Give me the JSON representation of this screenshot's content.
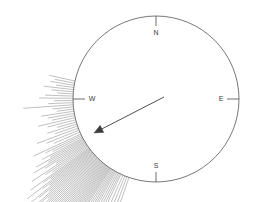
{
  "figure": {
    "name": "wind-rose-compass",
    "width": 254,
    "height": 202,
    "background_color": "#ffffff"
  },
  "chart_data": {
    "type": "scatter",
    "title": "",
    "subtitle": "",
    "xlabel": "",
    "ylabel": "",
    "grid": false,
    "legend_position": "none",
    "projection": "polar-compass",
    "circle": {
      "center_x": 156,
      "center_y": 99,
      "radius": 83,
      "stroke_color": "#555555",
      "stroke_width": 0.8,
      "fill": "none"
    },
    "cardinal_points": [
      {
        "label": "N",
        "angle_deg": 0,
        "tick_x1": 156,
        "tick_y1": 16,
        "tick_x2": 156,
        "tick_y2": 26,
        "label_x": 156,
        "label_y": 35,
        "anchor": "middle"
      },
      {
        "label": "E",
        "angle_deg": 90,
        "tick_x1": 239,
        "tick_y1": 99,
        "tick_x2": 227,
        "tick_y2": 99,
        "label_x": 221,
        "label_y": 101,
        "anchor": "middle"
      },
      {
        "label": "S",
        "angle_deg": 180,
        "tick_x1": 156,
        "tick_y1": 182,
        "tick_x2": 156,
        "tick_y2": 172,
        "label_x": 156,
        "label_y": 168,
        "anchor": "middle"
      },
      {
        "label": "W",
        "angle_deg": 270,
        "tick_x1": 73,
        "tick_y1": 99,
        "tick_x2": 85,
        "tick_y2": 99,
        "label_x": 92,
        "label_y": 101,
        "anchor": "middle"
      }
    ],
    "tick_style": {
      "stroke_color": "#4a4a4a",
      "stroke_width": 0.8
    },
    "mean_arrow": {
      "label": "mean direction",
      "tail_x": 164,
      "tail_y": 97,
      "tip_x": 94,
      "tip_y": 133,
      "bearing_deg": 242,
      "stroke_color": "#3c3c3c",
      "stroke_width": 0.9,
      "head_length": 9,
      "head_width": 4
    },
    "rays": {
      "stroke_color": "#8c8c8c",
      "stroke_width": 0.55,
      "origin_note": "each ray starts on the circle edge at its own bearing and extends radially outward",
      "bearings_deg": [
        282.5,
        281.0,
        279.5,
        278.0,
        276.5,
        275.0,
        273.5,
        272.0,
        270.5,
        269.0,
        267.5,
        266.0,
        264.5,
        263.0,
        261.5,
        260.0,
        258.5,
        257.0,
        255.5,
        254.0,
        252.5,
        251.0,
        249.5,
        248.0,
        246.5,
        245.0,
        244.0,
        243.0,
        242.0,
        241.2,
        240.4,
        239.6,
        238.8,
        238.0,
        237.2,
        236.4,
        235.6,
        234.8,
        234.0,
        233.4,
        232.8,
        232.2,
        231.6,
        231.0,
        230.4,
        229.8,
        229.2,
        228.6,
        228.0,
        227.4,
        226.8,
        226.2,
        225.6,
        225.0,
        224.4,
        223.8,
        223.2,
        222.6,
        222.0,
        221.4,
        220.8,
        220.2,
        219.6,
        219.0,
        218.4,
        217.8,
        217.2,
        216.6,
        216.0,
        215.4,
        214.8,
        214.2,
        213.6,
        213.0,
        212.2,
        211.4,
        210.6,
        209.8,
        209.0,
        208.0,
        207.0,
        206.0,
        205.0,
        203.5,
        202.0,
        200.5,
        199.0
      ],
      "lengths_px": [
        26,
        20,
        24,
        18,
        30,
        22,
        16,
        28,
        34,
        19,
        25,
        50,
        21,
        17,
        33,
        27,
        23,
        38,
        29,
        20,
        31,
        24,
        44,
        35,
        28,
        52,
        40,
        33,
        46,
        38,
        55,
        42,
        60,
        48,
        36,
        66,
        51,
        44,
        72,
        57,
        49,
        80,
        62,
        54,
        88,
        70,
        58,
        95,
        76,
        64,
        102,
        82,
        68,
        110,
        88,
        73,
        118,
        94,
        78,
        125,
        100,
        84,
        132,
        106,
        89,
        138,
        112,
        93,
        144,
        118,
        97,
        150,
        124,
        101,
        155,
        128,
        104,
        158,
        130,
        106,
        96,
        82,
        70,
        58,
        46,
        34,
        26
      ]
    }
  }
}
